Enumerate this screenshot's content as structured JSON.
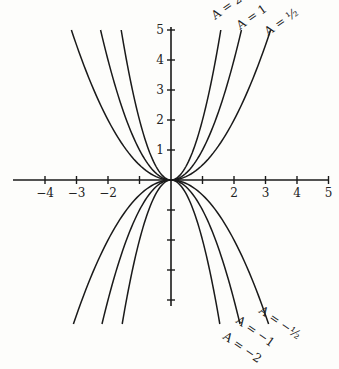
{
  "chart_data": {
    "type": "line",
    "title": "",
    "xlabel": "",
    "ylabel": "",
    "function": "y = A x^2",
    "xlim": [
      -5,
      5
    ],
    "ylim": [
      -5,
      5
    ],
    "grid": false,
    "legend": "inline labels at curve ends",
    "x_ticks": [
      -4,
      -3,
      -2,
      -1,
      1,
      2,
      3,
      4,
      5
    ],
    "x_tick_labels": [
      "−4",
      "−3",
      "−2",
      "",
      "",
      "2",
      "3",
      "4",
      "5"
    ],
    "y_ticks": [
      1,
      2,
      3,
      4,
      5,
      -1,
      -2,
      -3,
      -4
    ],
    "y_tick_labels": [
      "1",
      "2",
      "3",
      "4",
      "5",
      "",
      "",
      "",
      ""
    ],
    "series": [
      {
        "name": "A = 2",
        "A": 2,
        "label": "A = 2"
      },
      {
        "name": "A = 1",
        "A": 1,
        "label": "A = 1"
      },
      {
        "name": "A = ½",
        "A": 0.5,
        "label": "A = ½"
      },
      {
        "name": "A = −2",
        "A": -2,
        "label": "A = −2"
      },
      {
        "name": "A = −1",
        "A": -1,
        "label": "A = −1"
      },
      {
        "name": "A = −½",
        "A": -0.5,
        "label": "A = −½"
      }
    ]
  },
  "layout": {
    "origin_px": [
      171,
      180
    ],
    "x_unit_px": 31.5,
    "y_unit_px": 30,
    "line_color": "#1a1a1a"
  }
}
